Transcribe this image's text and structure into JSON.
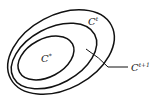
{
  "diagram": {
    "type": "nested-contours",
    "stroke_color": "#111111",
    "background": "#ffffff",
    "contours": [
      {
        "id": "outer",
        "label": ""
      },
      {
        "id": "middle",
        "label": ""
      },
      {
        "id": "inner",
        "label": ""
      }
    ],
    "labels": {
      "optimum": {
        "base": "C",
        "sup": "*"
      },
      "current": {
        "base": "C",
        "sup": "t"
      },
      "next": {
        "base": "C",
        "sup": "t+1"
      }
    }
  }
}
